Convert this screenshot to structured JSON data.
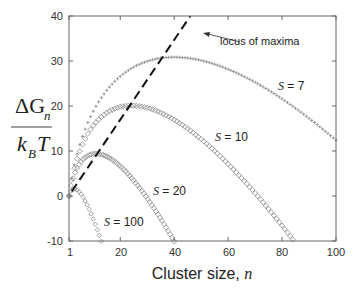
{
  "chart_data": {
    "type": "scatter",
    "title": "",
    "xlabel": "Cluster size, n",
    "ylabel": "ΔG_n / (k_B T)",
    "xlim": [
      1,
      100
    ],
    "ylim": [
      -10,
      40
    ],
    "x_ticks": [
      1,
      20,
      40,
      60,
      80,
      100
    ],
    "y_ticks": [
      -10,
      0,
      10,
      20,
      30,
      40
    ],
    "grid": false,
    "legend": "inline labels",
    "model": "ΔG_n/k_BT = -(n-1) ln S + θ (n^(2/3) - 1), θ ≈ 10",
    "series": [
      {
        "name": "S = 7",
        "S": 7,
        "marker": "plus",
        "peak": {
          "n": 40,
          "value": 31
        },
        "x": [
          1,
          10,
          20,
          30,
          40,
          50,
          60,
          70,
          80,
          90,
          100
        ],
        "values": [
          0,
          19.3,
          27.1,
          30.2,
          30.9,
          30.0,
          27.8,
          24.7,
          20.9,
          16.8,
          12.3
        ]
      },
      {
        "name": "S = 10",
        "S": 10,
        "marker": "diamond",
        "peak": {
          "n": 24,
          "value": 20
        },
        "x": [
          1,
          10,
          20,
          24,
          30,
          40,
          50,
          60,
          70,
          84
        ],
        "values": [
          0,
          15.6,
          19.8,
          20.1,
          19.6,
          16.8,
          12.6,
          7.4,
          1.3,
          -9.7
        ]
      },
      {
        "name": "S = 20",
        "S": 20,
        "marker": "diamond",
        "peak": {
          "n": 11,
          "value": 9.4
        },
        "x": [
          1,
          5,
          11,
          15,
          20,
          25,
          30,
          35,
          40
        ],
        "values": [
          0,
          7.3,
          9.4,
          8.9,
          6.7,
          3.6,
          -0.2,
          -4.6,
          -10.0
        ]
      },
      {
        "name": "S = 100",
        "S": 100,
        "marker": "diamond",
        "peak": {
          "n": 3,
          "value": 1.6
        },
        "x": [
          1,
          2,
          3,
          5,
          7,
          9,
          11,
          13
        ],
        "values": [
          0,
          1.3,
          1.6,
          0.7,
          -1.4,
          -4.2,
          -7.0,
          -10.1
        ]
      }
    ],
    "annotations": [
      {
        "text": "locus of maxima",
        "type": "dashed line with arrow",
        "from": {
          "n": 2,
          "value": 1
        },
        "to": {
          "n": 46,
          "value": 40
        }
      }
    ]
  },
  "labels": {
    "x_title_text": "Cluster size, ",
    "x_title_var": "n",
    "y_num_delta": "ΔG",
    "y_num_sub": "n",
    "y_den_k": "k",
    "y_den_sub": "B",
    "y_den_T": "T",
    "locus": "locus of maxima",
    "s7": "S",
    "s7_eq": " = 7",
    "s10": "S",
    "s10_eq": " = 10",
    "s20": "S",
    "s20_eq": " = 20",
    "s100": "S",
    "s100_eq": " = 100"
  },
  "colors": {
    "axis": "#555555",
    "markers": "#8a8a8a",
    "dashed": "#111111",
    "text": "#222222"
  }
}
